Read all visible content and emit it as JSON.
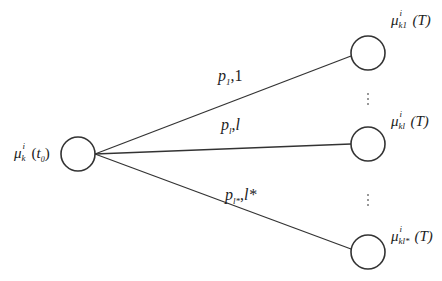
{
  "diagram": {
    "type": "tree-branching",
    "root_node": {
      "label_symbol": "μ",
      "label_superscript": "i",
      "label_subscript": "k",
      "label_argument": "(t",
      "label_argument_sub": "0",
      "label_argument_close": ")",
      "cx": 78,
      "cy": 154,
      "r": 17
    },
    "leaf_nodes": [
      {
        "label_symbol": "μ",
        "label_superscript": "i",
        "label_subscript": "k1",
        "label_argument": "(T)",
        "cx": 368,
        "cy": 53,
        "r": 17
      },
      {
        "label_symbol": "μ",
        "label_superscript": "i",
        "label_subscript": "kl",
        "label_argument": "(T)",
        "cx": 368,
        "cy": 144,
        "r": 17
      },
      {
        "label_symbol": "μ",
        "label_superscript": "i",
        "label_subscript": "kl*",
        "label_argument": "(T)",
        "cx": 368,
        "cy": 252,
        "r": 17
      }
    ],
    "edges": [
      {
        "label_p": "p",
        "label_p_sub": "1",
        "label_sep": ",",
        "label_index": "1",
        "from": [
          95,
          154
        ],
        "to": [
          351,
          53
        ]
      },
      {
        "label_p": "p",
        "label_p_sub": "l",
        "label_sep": ",",
        "label_index": "l",
        "from": [
          95,
          154
        ],
        "to": [
          351,
          144
        ]
      },
      {
        "label_p": "p",
        "label_p_sub": "l*",
        "label_sep": ",",
        "label_index": "l*",
        "from": [
          95,
          154
        ],
        "to": [
          351,
          252
        ]
      }
    ],
    "ellipsis": [
      "⋮",
      "⋮"
    ],
    "colors": {
      "stroke": "#333333",
      "text": "#222222",
      "dots": "#777777",
      "background": "#ffffff"
    }
  }
}
